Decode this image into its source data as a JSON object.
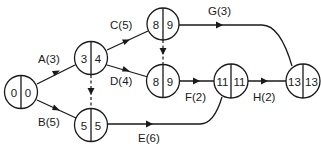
{
  "diagram": {
    "type": "activity-on-arrow network",
    "nodes": [
      {
        "id": "n1",
        "left": "0",
        "right": "0",
        "cx": 21,
        "cy": 92
      },
      {
        "id": "n2",
        "left": "3",
        "right": "4",
        "cx": 91,
        "cy": 58
      },
      {
        "id": "n3",
        "left": "5",
        "right": "5",
        "cx": 91,
        "cy": 125
      },
      {
        "id": "n4",
        "left": "8",
        "right": "9",
        "cx": 163,
        "cy": 24
      },
      {
        "id": "n5",
        "left": "8",
        "right": "9",
        "cx": 163,
        "cy": 81
      },
      {
        "id": "n6",
        "left": "11",
        "right": "11",
        "cx": 231,
        "cy": 81
      },
      {
        "id": "n7",
        "left": "13",
        "right": "13",
        "cx": 304,
        "cy": 81
      }
    ],
    "activities": [
      {
        "id": "A",
        "label": "A(3)",
        "from": "n1",
        "to": "n2"
      },
      {
        "id": "B",
        "label": "B(5)",
        "from": "n1",
        "to": "n3"
      },
      {
        "id": "C",
        "label": "C(5)",
        "from": "n2",
        "to": "n4"
      },
      {
        "id": "D",
        "label": "D(4)",
        "from": "n2",
        "to": "n5"
      },
      {
        "id": "E",
        "label": "E(6)",
        "from": "n3",
        "to": "n6"
      },
      {
        "id": "F",
        "label": "F(2)",
        "from": "n5",
        "to": "n6"
      },
      {
        "id": "G",
        "label": "G(3)",
        "from": "n4",
        "to": "n7"
      },
      {
        "id": "H",
        "label": "H(2)",
        "from": "n6",
        "to": "n7"
      }
    ],
    "dummies": [
      {
        "from": "n2",
        "to": "n3"
      },
      {
        "from": "n4",
        "to": "n5"
      }
    ]
  }
}
